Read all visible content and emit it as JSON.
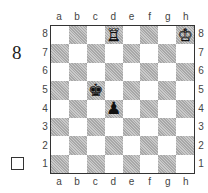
{
  "diagram": {
    "number": "8",
    "to_move_indicator": "white-square",
    "files": [
      "a",
      "b",
      "c",
      "d",
      "e",
      "f",
      "g",
      "h"
    ],
    "ranks": [
      "8",
      "7",
      "6",
      "5",
      "4",
      "3",
      "2",
      "1"
    ],
    "pieces": [
      {
        "square": "d8",
        "piece": "rook",
        "color": "white",
        "glyph": "♖"
      },
      {
        "square": "h8",
        "piece": "king",
        "color": "white",
        "glyph": "♔"
      },
      {
        "square": "c5",
        "piece": "king",
        "color": "black",
        "glyph": "♚"
      },
      {
        "square": "d4",
        "piece": "pawn",
        "color": "black",
        "glyph": "♟"
      }
    ],
    "colors": {
      "light_square": "#ffffff",
      "dark_square": "#b9b9b9",
      "border": "#333333"
    }
  }
}
